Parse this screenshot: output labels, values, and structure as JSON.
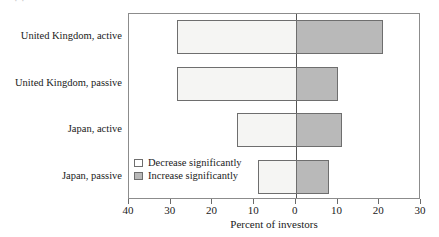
{
  "figure": {
    "title_remnant": "·                    ·",
    "axis_title": "Percent of investors",
    "legend": [
      {
        "key": "decrease",
        "label": "Decrease significantly",
        "color": "#ffffff"
      },
      {
        "key": "increase",
        "label": "Increase significantly",
        "color": "#b9b9b9"
      }
    ],
    "tick_labels": [
      "40",
      "30",
      "20",
      "10",
      "0",
      "10",
      "20",
      "30"
    ],
    "colors": {
      "decrease_fill": "#f5f5f3",
      "increase_fill": "#b9b9b9",
      "bar_border": "#6e6e6e",
      "frame": "#8c8c8c",
      "zero_line": "#555555",
      "text": "#1a1a1a"
    }
  },
  "chart_data": {
    "type": "bar",
    "orientation": "horizontal",
    "style": "diverging",
    "title": "",
    "xlabel": "Percent of investors",
    "ylabel": "",
    "xlim": [
      -40,
      30
    ],
    "xticks": [
      -40,
      -30,
      -20,
      -10,
      0,
      10,
      20,
      30
    ],
    "xtick_labels": [
      "40",
      "30",
      "20",
      "10",
      "0",
      "10",
      "20",
      "30"
    ],
    "grid": false,
    "legend_position": "inside-lower-left",
    "categories": [
      "United Kingdom, active",
      "United Kingdom, passive",
      "Japan, active",
      "Japan, passive"
    ],
    "series": [
      {
        "name": "Decrease significantly",
        "color": "#f5f5f3",
        "direction": "left",
        "values": [
          28.5,
          28.5,
          14,
          9
        ]
      },
      {
        "name": "Increase significantly",
        "color": "#b9b9b9",
        "direction": "right",
        "values": [
          21,
          10,
          11,
          8
        ]
      }
    ]
  }
}
